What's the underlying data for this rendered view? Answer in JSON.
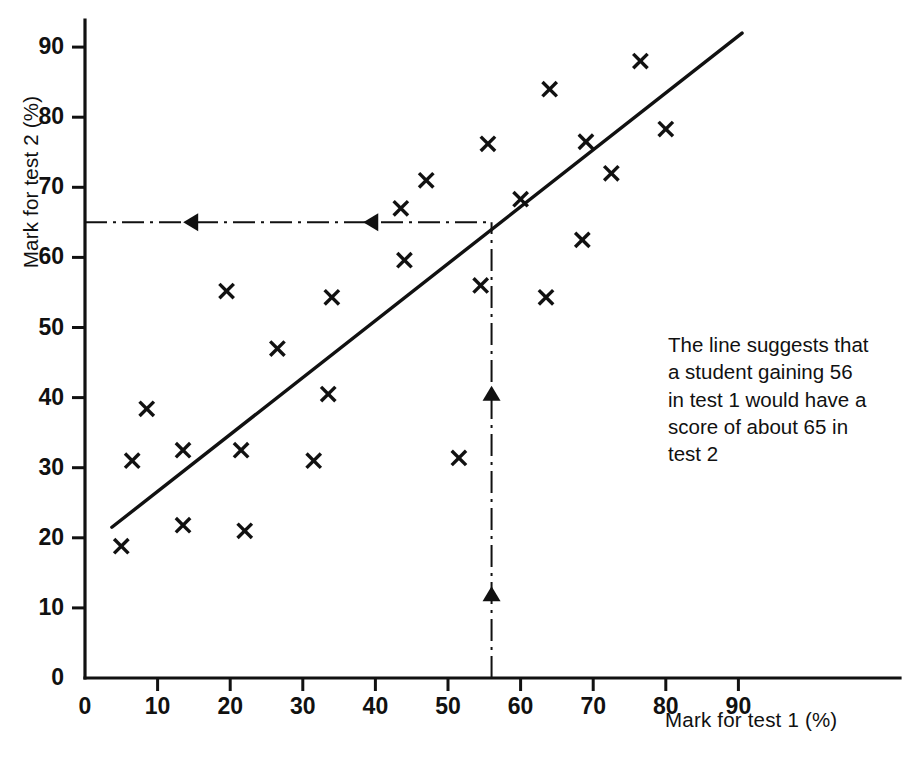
{
  "chart_data": {
    "type": "scatter",
    "title": "",
    "xlabel": "Mark for test 1 (%)",
    "ylabel": "Mark for test 2 (%)",
    "xlim": [
      0,
      96
    ],
    "ylim": [
      0,
      96
    ],
    "xticks": [
      0,
      10,
      20,
      30,
      40,
      50,
      60,
      70,
      80,
      90
    ],
    "yticks": [
      0,
      10,
      20,
      30,
      40,
      50,
      60,
      70,
      80,
      90
    ],
    "xtick_labels": [
      "0",
      "10",
      "20",
      "30",
      "40",
      "50",
      "60",
      "70",
      "80",
      "90"
    ],
    "ytick_labels": [
      "0",
      "10",
      "20",
      "30",
      "40",
      "50",
      "60",
      "70",
      "80",
      "90"
    ],
    "grid": false,
    "legend": "none",
    "marker": "x",
    "series": [
      {
        "name": "Students",
        "points": [
          [
            5.0,
            18.8
          ],
          [
            6.5,
            31.0
          ],
          [
            8.5,
            38.4
          ],
          [
            13.5,
            21.8
          ],
          [
            13.5,
            32.5
          ],
          [
            19.5,
            55.2
          ],
          [
            21.5,
            32.5
          ],
          [
            22.0,
            21.0
          ],
          [
            26.5,
            47.0
          ],
          [
            31.5,
            31.0
          ],
          [
            33.5,
            40.5
          ],
          [
            34.0,
            54.3
          ],
          [
            43.5,
            67.0
          ],
          [
            44.0,
            59.6
          ],
          [
            47.0,
            71.0
          ],
          [
            51.5,
            31.4
          ],
          [
            54.5,
            56.0
          ],
          [
            55.5,
            76.2
          ],
          [
            60.0,
            68.3
          ],
          [
            63.5,
            54.3
          ],
          [
            64.0,
            84.0
          ],
          [
            68.5,
            62.5
          ],
          [
            69.0,
            76.5
          ],
          [
            72.5,
            72.0
          ],
          [
            76.5,
            88.0
          ],
          [
            80.0,
            78.3
          ]
        ]
      }
    ],
    "fit_line": {
      "name": "line of best fit",
      "x0": 3.7,
      "y0": 21.5,
      "x1": 90.5,
      "y1": 92.0
    },
    "guides": [
      {
        "name": "vertical-reading-line",
        "orientation": "vertical",
        "x": 56.0,
        "y_from": 0,
        "y_to": 65.0,
        "style": "dash-dot",
        "arrows": [
          {
            "direction": "up",
            "at_y": 41.4
          },
          {
            "direction": "up",
            "at_y": 12.8
          }
        ]
      },
      {
        "name": "horizontal-reading-line",
        "orientation": "horizontal",
        "y": 65.0,
        "x_from": 0,
        "x_to": 56.0,
        "style": "dash-dot",
        "arrows": [
          {
            "direction": "left",
            "at_x": 13.8
          },
          {
            "direction": "left",
            "at_x": 38.6
          }
        ]
      }
    ],
    "annotation": {
      "text": "The line suggests that a student gaining 56 in test 1 would have a score of about 65 in test 2",
      "lines": [
        "The line suggests that",
        "a student gaining 56",
        "in test 1 would have a",
        "score of about 65 in",
        "test 2"
      ],
      "reads_test1_value": "56",
      "reads_test2_value": "65"
    },
    "colors": {
      "ink": "#111111",
      "background": "#ffffff"
    }
  }
}
